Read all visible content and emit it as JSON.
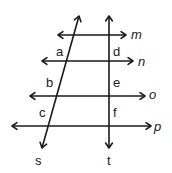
{
  "diagram": {
    "parallel_lines": [
      {
        "name": "m",
        "y": 35,
        "x1": 58,
        "x2": 126,
        "label_x": 131,
        "label_y": 39
      },
      {
        "name": "n",
        "y": 61,
        "x1": 42,
        "x2": 133,
        "label_x": 138,
        "label_y": 66
      },
      {
        "name": "o",
        "y": 96,
        "x1": 30,
        "x2": 145,
        "label_x": 149,
        "label_y": 99
      },
      {
        "name": "p",
        "y": 126,
        "x1": 12,
        "x2": 151,
        "label_x": 154,
        "label_y": 131
      }
    ],
    "transversals": [
      {
        "name": "s",
        "x1": 79,
        "y1": 16,
        "x2": 42,
        "y2": 148,
        "label_x": 35,
        "label_y": 165
      },
      {
        "name": "t",
        "x1": 109,
        "y1": 16,
        "x2": 109,
        "y2": 148,
        "label_x": 107,
        "label_y": 165
      }
    ],
    "segment_labels": [
      {
        "text": "a",
        "x": 56,
        "y": 56
      },
      {
        "text": "b",
        "x": 46,
        "y": 87
      },
      {
        "text": "c",
        "x": 39,
        "y": 117
      },
      {
        "text": "d",
        "x": 113,
        "y": 56
      },
      {
        "text": "e",
        "x": 113,
        "y": 87
      },
      {
        "text": "f",
        "x": 113,
        "y": 117
      }
    ],
    "stroke_color": "#1a1a1a"
  }
}
